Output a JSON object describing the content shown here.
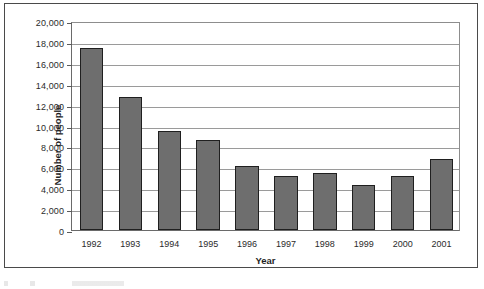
{
  "chart_data": {
    "type": "bar",
    "title": "",
    "xlabel": "Year",
    "ylabel": "Number of people",
    "categories": [
      "1992",
      "1993",
      "1994",
      "1995",
      "1996",
      "1997",
      "1998",
      "1999",
      "2000",
      "2001"
    ],
    "values": [
      17400,
      12700,
      9500,
      8600,
      6100,
      5200,
      5500,
      4300,
      5200,
      6800
    ],
    "ylim": [
      0,
      20000
    ],
    "ytick_step": 2000,
    "ytick_labels": [
      "0",
      "2,000",
      "4,000",
      "6,000",
      "8,000",
      "10,000",
      "12,000",
      "14,000",
      "16,000",
      "18,000",
      "20,000"
    ],
    "ytick_values": [
      0,
      2000,
      4000,
      6000,
      8000,
      10000,
      12000,
      14000,
      16000,
      18000,
      20000
    ],
    "grid": true,
    "legend": false,
    "series": [
      {
        "name": "Number of people",
        "values": [
          17400,
          12700,
          9500,
          8600,
          6100,
          5200,
          5500,
          4300,
          5200,
          6800
        ]
      }
    ],
    "colors": {
      "bar_fill": "#6e6e6e",
      "bar_border": "#1f1f1f",
      "gridline": "#9a9a9a",
      "axis": "#6a6a6a",
      "text": "#2b2b2b",
      "frame": "#4a4a4a",
      "background": "#ffffff"
    }
  }
}
